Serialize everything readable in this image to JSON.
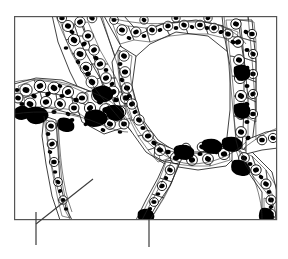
{
  "figure": {
    "title": "Histological line drawing of branching cellular trabeculae",
    "background_color": "#ffffff",
    "ink_color": "#000000",
    "frame_color": "#4a4a4a"
  },
  "frame": {
    "name": "image-border",
    "x": 14,
    "y": 16,
    "width": 263,
    "height": 204,
    "stroke": "#555555",
    "stroke_width": 1.2
  },
  "leaders": [
    {
      "name": "leader-line-left-diagonal",
      "type": "diagonal",
      "x1": 36,
      "y1": 224,
      "x2": 93,
      "y2": 179,
      "stroke": "#3b3b3b",
      "stroke_width": 1.1
    },
    {
      "name": "leader-tick-left-vertical",
      "type": "vertical",
      "x1": 36,
      "y1": 212,
      "x2": 36,
      "y2": 245,
      "stroke": "#3b3b3b",
      "stroke_width": 1.2
    },
    {
      "name": "leader-tick-center-vertical",
      "type": "vertical",
      "x1": 149,
      "y1": 219,
      "x2": 149,
      "y2": 247,
      "stroke": "#3b3b3b",
      "stroke_width": 1.2
    }
  ],
  "structures": {
    "open_spaces": [
      {
        "name": "large-central-lumen",
        "cx": 172,
        "cy": 95,
        "rx": 58,
        "ry": 55
      },
      {
        "name": "lower-left-open-space",
        "cx": 92,
        "cy": 178,
        "rx": 58,
        "ry": 36
      },
      {
        "name": "lower-right-open-space",
        "cx": 215,
        "cy": 195,
        "rx": 42,
        "ry": 26
      },
      {
        "name": "upper-left-open-space",
        "cx": 55,
        "cy": 45,
        "rx": 36,
        "ry": 26
      },
      {
        "name": "right-margin-open-space",
        "cx": 262,
        "cy": 140,
        "rx": 18,
        "ry": 30
      }
    ],
    "trabeculae": [
      {
        "name": "trabecula-upper-left-branch",
        "note": "runs from top border down-left to the central dense node"
      },
      {
        "name": "trabecula-left-horizontal-branch",
        "note": "extends left from the dense node toward the left border"
      },
      {
        "name": "trabecula-central-arch",
        "note": "arches right and down around the large central lumen"
      },
      {
        "name": "trabecula-right-vertical-column",
        "note": "vertical band at the right descending from the top border"
      },
      {
        "name": "trabecula-lower-right-fork",
        "note": "Y shaped fork toward the bottom right corner"
      },
      {
        "name": "trabecula-lower-left-stem",
        "note": "thin stem descending to the bottom border near the left leader"
      },
      {
        "name": "trabecula-lower-center-stem",
        "note": "stem descending to the bottom border near the center leader"
      }
    ],
    "cell_count_estimate": 340,
    "nucleus_fill": "#000000",
    "cell_outline": "#1a1a1a"
  },
  "labels": {
    "left_marker": "",
    "center_marker": ""
  }
}
